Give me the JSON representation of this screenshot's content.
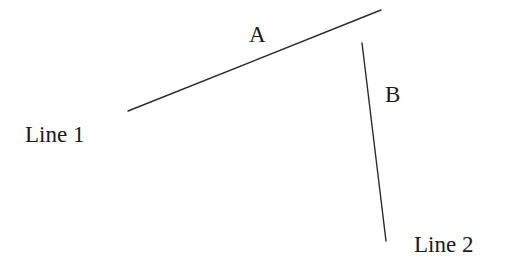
{
  "diagram": {
    "background": "#ffffff",
    "stroke_color": "#2a2a2a",
    "lines": [
      {
        "id": "line1",
        "name": "Line 1",
        "segment_label": "A",
        "x1": 128,
        "y1": 111,
        "x2": 381,
        "y2": 10
      },
      {
        "id": "line2",
        "name": "Line 2",
        "segment_label": "B",
        "x1": 362,
        "y1": 43,
        "x2": 386,
        "y2": 241
      }
    ],
    "labels": {
      "segment_a": "A",
      "segment_b": "B",
      "line1": "Line 1",
      "line2": "Line 2"
    }
  }
}
